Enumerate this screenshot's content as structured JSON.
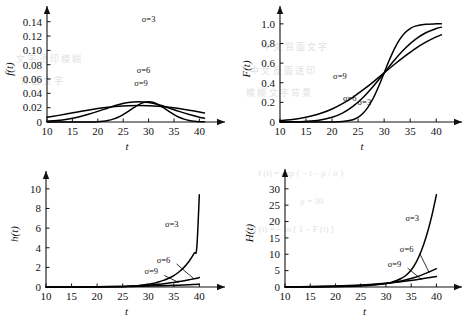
{
  "figure": {
    "background_color": "#ffffff",
    "ink_color": "#111111",
    "panel_count": 4,
    "bleed_through": [
      {
        "text": "中 文 背 面 文 字",
        "x": 262,
        "y": 40
      },
      {
        "text": "中 文 反 面 透 印",
        "x": 250,
        "y": 64
      },
      {
        "text": "模 糊 文 字 背 景",
        "x": 246,
        "y": 86
      },
      {
        "text": "文 字 透 印 模 糊",
        "x": 16,
        "y": 52
      },
      {
        "text": "背 面 文 字",
        "x": 20,
        "y": 74
      },
      {
        "text": "f (t) = exp ( − t − μ / σ )",
        "x": 258,
        "y": 168
      },
      {
        "text": "H (t) = − ln [ 1 − F (t) ]",
        "x": 250,
        "y": 224
      },
      {
        "text": "μ = 30",
        "x": 300,
        "y": 196
      }
    ]
  },
  "chart_data": [
    {
      "id": "pdf",
      "type": "line",
      "title": "",
      "xlabel": "t",
      "ylabel": "f(t)",
      "xlim": [
        10,
        41.5
      ],
      "ylim": [
        0,
        0.148
      ],
      "xticks": [
        10,
        15,
        20,
        25,
        30,
        35,
        40
      ],
      "xticklabels": [
        "10",
        "15",
        "20",
        "25",
        "30",
        "35",
        "40"
      ],
      "yticks": [
        0,
        0.02,
        0.04,
        0.06,
        0.08,
        0.1,
        0.12,
        0.14
      ],
      "yticklabels": [
        "0",
        "0.02",
        "0.04",
        "0.06",
        "0.08",
        "0.10",
        "0.12",
        "0.14"
      ],
      "grid": false,
      "legend_position": "inline-annotations",
      "mu": 30,
      "series": [
        {
          "name": "σ=3",
          "label": "σ=3",
          "label_x": 30.0,
          "label_y": 0.139,
          "x": [
            10,
            12,
            14,
            16,
            18,
            20,
            21,
            22,
            23,
            24,
            25,
            26,
            27,
            28,
            29,
            30,
            31,
            32,
            33,
            34,
            35,
            36,
            37,
            38,
            39,
            40,
            41
          ],
          "values": [
            0.0,
            0.0,
            0.0,
            0.0,
            0.0001,
            0.0005,
            0.0011,
            0.0022,
            0.004,
            0.0067,
            0.0104,
            0.0148,
            0.0196,
            0.024,
            0.0272,
            0.0284,
            0.0272,
            0.024,
            0.0196,
            0.0148,
            0.0104,
            0.0067,
            0.004,
            0.0022,
            0.0011,
            0.0005,
            0.0002
          ]
        },
        {
          "name": "σ=6",
          "label": "σ=6",
          "label_x": 29.0,
          "label_y": 0.068,
          "x": [
            10,
            12,
            14,
            16,
            18,
            20,
            22,
            24,
            26,
            28,
            30,
            32,
            34,
            36,
            38,
            40,
            41
          ],
          "values": [
            0.0011,
            0.0022,
            0.004,
            0.0067,
            0.0104,
            0.0148,
            0.0196,
            0.024,
            0.0272,
            0.0284,
            0.0272,
            0.024,
            0.0196,
            0.0148,
            0.0104,
            0.0067,
            0.0053
          ]
        },
        {
          "name": "σ=9",
          "label": "σ=9",
          "label_x": 28.5,
          "label_y": 0.05,
          "x": [
            10,
            12,
            14,
            16,
            18,
            20,
            22,
            24,
            26,
            28,
            30,
            32,
            34,
            36,
            38,
            40,
            41
          ],
          "values": [
            0.0066,
            0.0089,
            0.0114,
            0.014,
            0.0165,
            0.0188,
            0.0207,
            0.022,
            0.0228,
            0.0231,
            0.0228,
            0.022,
            0.0207,
            0.0188,
            0.0165,
            0.014,
            0.0127
          ]
        }
      ]
    },
    {
      "id": "cdf",
      "type": "line",
      "title": "",
      "xlabel": "t",
      "ylabel": "F(t)",
      "xlim": [
        10,
        41.5
      ],
      "ylim": [
        0,
        1.08
      ],
      "xticks": [
        10,
        15,
        20,
        25,
        30,
        35,
        40
      ],
      "xticklabels": [
        "10",
        "15",
        "20",
        "25",
        "30",
        "35",
        "40"
      ],
      "yticks": [
        0,
        0.2,
        0.4,
        0.6,
        0.8,
        1.0
      ],
      "yticklabels": [
        "0",
        "0.2",
        "0.4",
        "0.6",
        "0.8",
        "1.0"
      ],
      "grid": false,
      "legend_position": "inline-annotations",
      "mu": 30,
      "series": [
        {
          "name": "σ=3",
          "label": "σ=3",
          "label_x": 26.2,
          "label_y": 0.175,
          "x": [
            10,
            14,
            18,
            20,
            22,
            24,
            25,
            26,
            27,
            28,
            29,
            30,
            31,
            32,
            33,
            34,
            35,
            36,
            38,
            40,
            41
          ],
          "values": [
            0.0,
            0.0,
            0.0,
            0.0004,
            0.004,
            0.023,
            0.048,
            0.091,
            0.159,
            0.252,
            0.369,
            0.5,
            0.631,
            0.748,
            0.841,
            0.909,
            0.952,
            0.977,
            0.996,
            1.0,
            1.0
          ]
        },
        {
          "name": "σ=6",
          "label": "σ=6",
          "label_x": 23.4,
          "label_y": 0.215,
          "x": [
            10,
            12,
            14,
            16,
            18,
            20,
            22,
            24,
            26,
            28,
            30,
            32,
            34,
            36,
            38,
            40,
            41
          ],
          "values": [
            0.0004,
            0.0013,
            0.0038,
            0.01,
            0.023,
            0.048,
            0.091,
            0.159,
            0.252,
            0.369,
            0.5,
            0.631,
            0.748,
            0.841,
            0.909,
            0.952,
            0.966
          ]
        },
        {
          "name": "σ=9",
          "label": "σ=9",
          "label_x": 21.5,
          "label_y": 0.435,
          "x": [
            10,
            12,
            14,
            16,
            18,
            20,
            22,
            24,
            26,
            28,
            30,
            32,
            34,
            36,
            38,
            40,
            41
          ],
          "values": [
            0.013,
            0.023,
            0.038,
            0.061,
            0.091,
            0.133,
            0.187,
            0.252,
            0.329,
            0.412,
            0.5,
            0.588,
            0.671,
            0.748,
            0.813,
            0.867,
            0.889
          ]
        }
      ]
    },
    {
      "id": "hazard",
      "type": "line",
      "title": "",
      "xlabel": "t",
      "ylabel": "h(t)",
      "xlim": [
        10,
        41.5
      ],
      "ylim": [
        0,
        10.8
      ],
      "xticks": [
        10,
        15,
        20,
        25,
        30,
        35,
        40
      ],
      "xticklabels": [
        "10",
        "15",
        "20",
        "25",
        "30",
        "35",
        "40"
      ],
      "yticks": [
        0,
        2,
        4,
        6,
        8,
        10
      ],
      "yticklabels": [
        "0",
        "2",
        "4",
        "6",
        "8",
        "10"
      ],
      "grid": false,
      "legend_position": "inline-annotations-with-leaders",
      "mu": 30,
      "series": [
        {
          "name": "σ=3",
          "label": "σ=3",
          "label_x": 34.6,
          "label_y": 6.15,
          "leader": false,
          "x": [
            10,
            15,
            20,
            24,
            26,
            28,
            30,
            31,
            32,
            33,
            34,
            35,
            36,
            37,
            38,
            39,
            39.5,
            40
          ],
          "values": [
            0.0,
            0.0,
            0.01,
            0.03,
            0.07,
            0.14,
            0.27,
            0.37,
            0.5,
            0.67,
            0.89,
            1.17,
            1.53,
            2.0,
            2.62,
            3.45,
            4.0,
            9.4
          ]
        },
        {
          "name": "σ=6",
          "label": "σ=6",
          "label_x": 33.0,
          "label_y": 2.45,
          "leader": true,
          "leader_to_x": 38.8,
          "leader_to_y": 0.9,
          "x": [
            10,
            15,
            20,
            24,
            26,
            28,
            30,
            32,
            34,
            35,
            36,
            37,
            38,
            39,
            40
          ],
          "values": [
            0.0,
            0.01,
            0.02,
            0.05,
            0.08,
            0.13,
            0.19,
            0.28,
            0.4,
            0.47,
            0.55,
            0.64,
            0.74,
            0.84,
            0.96
          ]
        },
        {
          "name": "σ=9",
          "label": "σ=9",
          "label_x": 30.6,
          "label_y": 1.28,
          "leader": true,
          "leader_to_x": 36.0,
          "leader_to_y": 0.45,
          "x": [
            10,
            15,
            20,
            24,
            26,
            28,
            30,
            32,
            34,
            36,
            38,
            40
          ],
          "values": [
            0.01,
            0.01,
            0.02,
            0.04,
            0.05,
            0.07,
            0.09,
            0.12,
            0.15,
            0.19,
            0.24,
            0.29
          ]
        }
      ]
    },
    {
      "id": "cumhaz",
      "type": "line",
      "title": "",
      "xlabel": "t",
      "ylabel": "H(t)",
      "xlim": [
        10,
        41.5
      ],
      "ylim": [
        0,
        33
      ],
      "xticks": [
        10,
        15,
        20,
        25,
        30,
        35,
        40
      ],
      "xticklabels": [
        "10",
        "15",
        "20",
        "25",
        "30",
        "35",
        "40"
      ],
      "yticks": [
        0,
        5,
        10,
        15,
        20,
        25,
        30
      ],
      "yticklabels": [
        "0",
        "5",
        "10",
        "15",
        "20",
        "25",
        "30"
      ],
      "grid": false,
      "legend_position": "inline-annotations-with-leaders",
      "mu": 30,
      "series": [
        {
          "name": "σ=3",
          "label": "σ=3",
          "label_x": 35.2,
          "label_y": 20.3,
          "leader": false,
          "x": [
            10,
            15,
            20,
            24,
            26,
            28,
            30,
            31,
            32,
            33,
            34,
            35,
            36,
            37,
            38,
            39,
            40
          ],
          "values": [
            0.0,
            0.0,
            0.04,
            0.2,
            0.4,
            0.7,
            1.1,
            1.4,
            1.9,
            2.6,
            3.6,
            5.2,
            7.6,
            11.0,
            15.5,
            21.2,
            28.2
          ]
        },
        {
          "name": "σ=6",
          "label": "σ=6",
          "label_x": 34.1,
          "label_y": 10.6,
          "leader": true,
          "leader_to_x": 38.6,
          "leader_to_y": 4.3,
          "x": [
            10,
            15,
            20,
            24,
            26,
            28,
            30,
            32,
            34,
            36,
            38,
            40
          ],
          "values": [
            0.02,
            0.08,
            0.2,
            0.42,
            0.58,
            0.8,
            1.1,
            1.55,
            2.2,
            3.05,
            4.25,
            5.6
          ]
        },
        {
          "name": "σ=9",
          "label": "σ=9",
          "label_x": 31.7,
          "label_y": 6.1,
          "leader": true,
          "leader_to_x": 37.1,
          "leader_to_y": 2.25,
          "x": [
            10,
            15,
            20,
            24,
            26,
            28,
            30,
            32,
            34,
            36,
            38,
            40
          ],
          "values": [
            0.05,
            0.15,
            0.32,
            0.55,
            0.7,
            0.9,
            1.15,
            1.45,
            1.82,
            2.25,
            2.72,
            3.2
          ]
        }
      ]
    }
  ]
}
